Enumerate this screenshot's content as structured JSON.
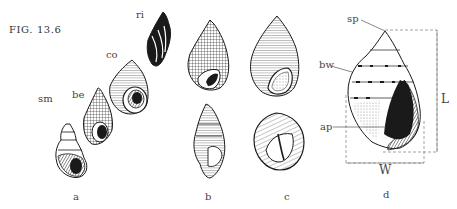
{
  "figure": {
    "title": "FIG. 13.6",
    "panels": [
      {
        "id": "a",
        "caption": "a",
        "shells": [
          {
            "abbr": "sm"
          },
          {
            "abbr": "be"
          },
          {
            "abbr": "co"
          },
          {
            "abbr": "ri"
          }
        ]
      },
      {
        "id": "b",
        "caption": "b"
      },
      {
        "id": "c",
        "caption": "c"
      },
      {
        "id": "d",
        "caption": "d",
        "annotations": [
          {
            "label": "sp"
          },
          {
            "label": "bw"
          },
          {
            "label": "ap"
          }
        ],
        "dimensions": {
          "length": "L",
          "width": "W"
        }
      }
    ]
  },
  "colors": {
    "ink": "#1a1a1a",
    "label": "#444444",
    "dashed": "#8a8a8a"
  }
}
